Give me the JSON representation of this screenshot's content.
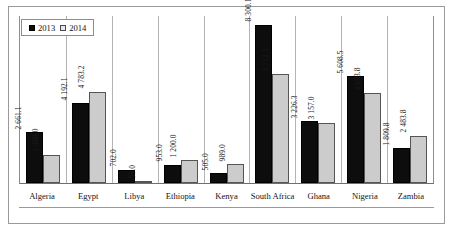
{
  "chart_data": {
    "type": "bar",
    "title": "",
    "xlabel": "",
    "ylabel": "",
    "grid": "vertical-category-separators",
    "legend_position": "top-left",
    "ylim": [
      0,
      8800
    ],
    "categories": [
      "Algeria",
      "Egypt",
      "Libya",
      "Ethiopia",
      "Kenya",
      "South Africa",
      "Ghana",
      "Nigeria",
      "Zambia"
    ],
    "series": [
      {
        "name": "2013",
        "color": "#0d0d0d",
        "values": [
          2661.1,
          4192.1,
          702.0,
          953.0,
          505.0,
          8300.1,
          3226.3,
          5608.5,
          1809.8
        ],
        "labels": [
          "2 661.1",
          "4 192.1",
          "702.0",
          "953.0",
          "505.0",
          "8 300.1",
          "3 226.3",
          "5 608.5",
          "1 809.8"
        ]
      },
      {
        "name": "2014",
        "color": "#cccccc",
        "values": [
          1488.0,
          4783.2,
          50.0,
          1200.0,
          989.0,
          5712.3,
          3157.0,
          4693.8,
          2483.8
        ],
        "labels": [
          "1 488.0",
          "4 783.2",
          "50.0",
          "1 200.0",
          "989.0",
          "5 712.3",
          "3 157.0",
          "4 693.8",
          "2 483.8"
        ]
      }
    ]
  },
  "legend": {
    "entries": [
      {
        "label": "2013",
        "swatch": "filled-black-square"
      },
      {
        "label": "2014",
        "swatch": "outlined-gray-square"
      }
    ]
  }
}
